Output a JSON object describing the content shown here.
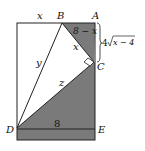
{
  "diagram": {
    "type": "geometry-figure",
    "colors": {
      "background": "#ffffff",
      "shade": "#7a7a7a",
      "line": "#222222"
    },
    "points": {
      "A": {
        "label": "A",
        "x": 95,
        "y": 23
      },
      "B": {
        "label": "B",
        "x": 62,
        "y": 23
      },
      "C": {
        "label": "C",
        "x": 94,
        "y": 62
      },
      "D": {
        "label": "D",
        "x": 17,
        "y": 128
      },
      "E": {
        "label": "E",
        "x": 95,
        "y": 128
      }
    },
    "segment_labels": {
      "top_left": "x",
      "BA": "8 − x",
      "BC": "x",
      "AC_prefix": "4",
      "AC_radicand": "x − 4",
      "BD": "y",
      "DC": "z",
      "DE": "8"
    },
    "right_angle_at": "C"
  }
}
